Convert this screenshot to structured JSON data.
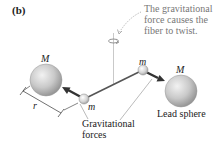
{
  "figure": {
    "panel_label": "(b)",
    "annotation": {
      "line1": "The gravitational",
      "line2": "force causes the",
      "line3": "fiber to twist."
    },
    "large_mass_left_label": "M",
    "large_mass_right_label": "M",
    "small_mass_left_label": "m",
    "small_mass_right_label": "m",
    "distance_label": "r",
    "forces_label": {
      "line1": "Gravitational",
      "line2": "forces"
    },
    "lead_sphere_label": "Lead sphere",
    "colors": {
      "sphere_fill": "#c8c8c8",
      "arrow": "#333333",
      "rod": "#555555",
      "annotation_text": "#777777"
    }
  }
}
